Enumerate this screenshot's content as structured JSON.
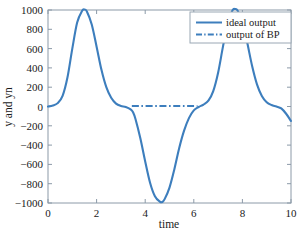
{
  "chart_data": {
    "type": "line",
    "title": "",
    "xlabel": "time",
    "ylabel": "y and yn",
    "xlim": [
      0,
      10
    ],
    "ylim": [
      -1000,
      1000
    ],
    "xticks": [
      0,
      2,
      4,
      6,
      8,
      10
    ],
    "xtick_labels": [
      "0",
      "2",
      "4",
      "6",
      "8",
      "10"
    ],
    "yticks": [
      -1000,
      -800,
      -600,
      -400,
      -200,
      0,
      200,
      400,
      600,
      800,
      1000
    ],
    "ytick_labels": [
      "-1000",
      "-800",
      "-600",
      "-400",
      "-200",
      "0",
      "200",
      "400",
      "600",
      "800",
      "1000"
    ],
    "grid": false,
    "legend_position": "upper right",
    "series": [
      {
        "name": "ideal output",
        "style": "solid",
        "color": "#3d7ebd",
        "x": [
          0.0,
          0.2,
          0.4,
          0.6,
          0.8,
          1.0,
          1.2,
          1.4,
          1.5,
          1.6,
          1.8,
          2.0,
          2.2,
          2.4,
          2.6,
          2.8,
          3.0,
          3.2,
          3.4,
          3.5,
          3.6,
          3.8,
          4.0,
          4.2,
          4.4,
          4.6,
          4.7,
          4.8,
          5.0,
          5.2,
          5.4,
          5.6,
          5.8,
          6.0,
          6.2,
          6.4,
          6.6,
          6.8,
          7.0,
          7.2,
          7.4,
          7.6,
          7.7,
          7.8,
          8.0,
          8.2,
          8.4,
          8.6,
          8.8,
          9.0,
          9.2,
          9.4,
          9.6,
          9.8,
          10.0
        ],
        "y": [
          0,
          10,
          35,
          110,
          300,
          600,
          870,
          990,
          1005,
          985,
          850,
          620,
          380,
          200,
          90,
          30,
          5,
          -5,
          -30,
          -60,
          -130,
          -330,
          -570,
          -790,
          -930,
          -985,
          -990,
          -960,
          -840,
          -650,
          -430,
          -250,
          -120,
          -40,
          -5,
          20,
          60,
          160,
          350,
          620,
          870,
          1000,
          1010,
          995,
          880,
          660,
          420,
          230,
          110,
          45,
          15,
          0,
          -20,
          -75,
          -150
        ]
      },
      {
        "name": "output of BP",
        "style": "dashdot",
        "color": "#3d7ebd",
        "x": [
          3.45,
          3.8,
          4.2,
          4.6,
          5.0,
          5.4,
          5.8,
          6.15
        ],
        "y": [
          5,
          5,
          5,
          5,
          5,
          5,
          5,
          5
        ]
      }
    ]
  },
  "legend": {
    "entries": [
      {
        "label": "ideal output"
      },
      {
        "label": "output of BP"
      }
    ]
  }
}
